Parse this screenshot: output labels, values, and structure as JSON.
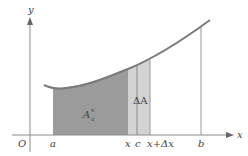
{
  "diagram": {
    "colors": {
      "background": "#ffffff",
      "axis": "#8a8a8a",
      "curve": "#7a7a7a",
      "region_fill": "#9b9b9b",
      "strip_fill": "#d3d3d3",
      "label": "#444444"
    },
    "axes": {
      "x_label": "x",
      "y_label": "y",
      "origin_label": "O"
    },
    "ticks": {
      "a": "a",
      "x": "x",
      "c": "c",
      "x_plus_dx": "x+Δx",
      "b": "b"
    },
    "regions": {
      "main_area_label": "A",
      "main_area_sup": "x",
      "main_area_sub": "a",
      "strip_label": "ΔA"
    }
  }
}
